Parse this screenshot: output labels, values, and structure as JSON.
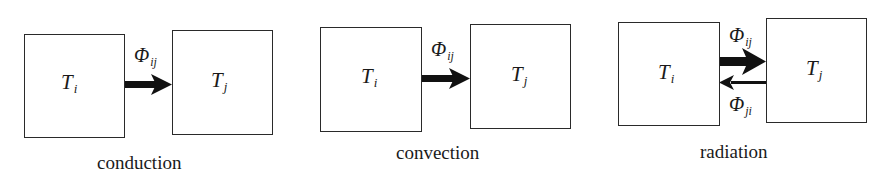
{
  "diagram": {
    "panels": [
      {
        "caption": "conduction",
        "source": {
          "symbol": "T",
          "sub": "i"
        },
        "target": {
          "symbol": "T",
          "sub": "j"
        },
        "flows": [
          {
            "symbol": "Φ",
            "sub": "ij",
            "direction": "i-to-j",
            "weight": "thick"
          }
        ]
      },
      {
        "caption": "convection",
        "source": {
          "symbol": "T",
          "sub": "i"
        },
        "target": {
          "symbol": "T",
          "sub": "j"
        },
        "flows": [
          {
            "symbol": "Φ",
            "sub": "ij",
            "direction": "i-to-j",
            "weight": "thick"
          }
        ]
      },
      {
        "caption": "radiation",
        "source": {
          "symbol": "T",
          "sub": "i"
        },
        "target": {
          "symbol": "T",
          "sub": "j"
        },
        "flows": [
          {
            "symbol": "Φ",
            "sub": "ij",
            "direction": "i-to-j",
            "weight": "thick"
          },
          {
            "symbol": "Φ",
            "sub": "ji",
            "direction": "j-to-i",
            "weight": "thin"
          }
        ]
      }
    ],
    "colors": {
      "stroke": "#2a2a2a",
      "arrow": "#111111",
      "background": "#ffffff"
    }
  }
}
